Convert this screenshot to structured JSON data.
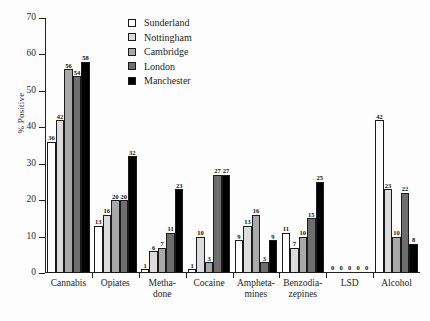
{
  "chart_data": {
    "type": "bar",
    "title": "",
    "subtitle": "",
    "xlabel": "",
    "ylabel": "% Positive",
    "ylim": [
      0,
      70
    ],
    "yticks": [
      0,
      10,
      20,
      30,
      40,
      50,
      60,
      70
    ],
    "grid": false,
    "legend_position": "top-right",
    "categories": [
      "Cannabis",
      "Opiates",
      "Metha-\ndone",
      "Cocaine",
      "Ampheta-\nmines",
      "Benzodia-\nzepines",
      "LSD",
      "Alcohol"
    ],
    "series": [
      {
        "name": "Sunderland",
        "color": "#ffffff",
        "values": [
          36,
          13,
          1,
          1,
          9,
          11,
          0,
          42
        ]
      },
      {
        "name": "Nottingham",
        "color": "#dcdcdc",
        "values": [
          42,
          16,
          6,
          10,
          13,
          7,
          0,
          23
        ]
      },
      {
        "name": "Cambridge",
        "color": "#a9a9a9",
        "values": [
          56,
          20,
          7,
          3,
          16,
          10,
          0,
          10
        ]
      },
      {
        "name": "London",
        "color": "#6e6e6e",
        "values": [
          54,
          20,
          11,
          27,
          3,
          15,
          0,
          22
        ]
      },
      {
        "name": "Manchester",
        "color": "#000000",
        "values": [
          58,
          32,
          23,
          27,
          9,
          25,
          0,
          8
        ]
      }
    ]
  },
  "legend": {
    "items": [
      {
        "label": "Sunderland"
      },
      {
        "label": "Nottingham"
      },
      {
        "label": "Cambridge"
      },
      {
        "label": "London"
      },
      {
        "label": "Manchester"
      }
    ]
  },
  "axes": {
    "y_title": "% Positive"
  }
}
